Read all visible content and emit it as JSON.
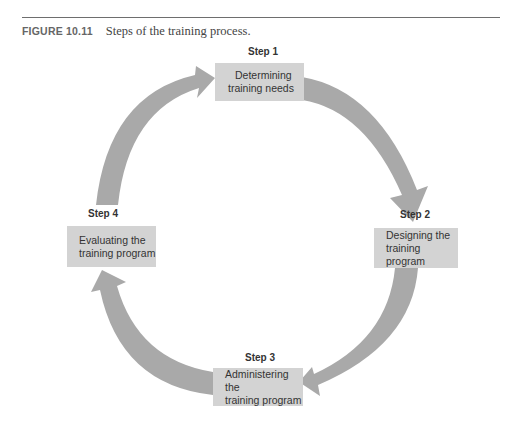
{
  "caption": {
    "figure_number": "FIGURE 10.11",
    "title": "Steps of the training process."
  },
  "steps": [
    {
      "label": "Step 1",
      "line1": "Determining",
      "line2": "training needs"
    },
    {
      "label": "Step 2",
      "line1": "Designing the",
      "line2": "training program"
    },
    {
      "label": "Step 3",
      "line1": "Administering the",
      "line2": "training program"
    },
    {
      "label": "Step 4",
      "line1": "Evaluating the",
      "line2": "training program"
    }
  ],
  "colors": {
    "box_fill": "#d3d3d3",
    "arrow_fill": "#a9a9a9",
    "text": "#333333"
  }
}
